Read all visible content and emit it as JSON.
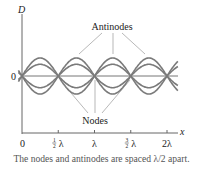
{
  "diagram": {
    "y_axis_label": "D",
    "x_axis_label": "x",
    "origin_label": "0",
    "antinodes_label": "Antinodes",
    "nodes_label": "Nodes",
    "x_ticks": [
      {
        "value": 0.5,
        "label_num": "1",
        "label_den": "2",
        "label_sym": "λ"
      },
      {
        "value": 1.0,
        "label": "λ"
      },
      {
        "value": 1.5,
        "label_num": "3",
        "label_den": "2",
        "label_sym": "λ"
      },
      {
        "value": 2.0,
        "label": "2λ"
      }
    ],
    "x_zero_label": "0",
    "wave_amplitudes": [
      1.0,
      0.65,
      -0.65,
      -1.0
    ],
    "x_range_wavelengths": [
      0,
      2.15
    ],
    "node_positions_wavelengths": [
      0,
      0.5,
      1.0,
      1.5,
      2.0
    ],
    "curve_color": "#7a7a7a"
  },
  "caption": "The nodes and antinodes are spaced λ/2 apart."
}
